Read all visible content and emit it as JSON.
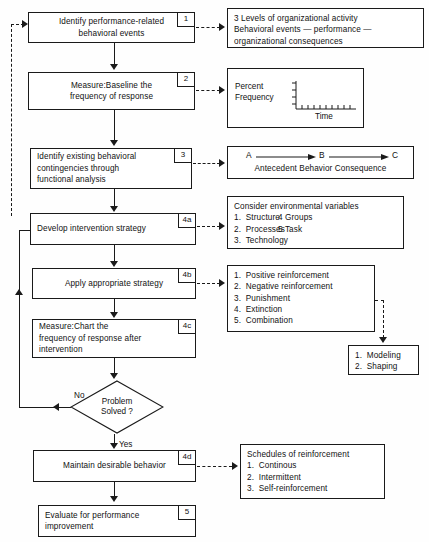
{
  "diagram": {
    "steps": [
      {
        "id": "1",
        "text": "Identify performance-related\nbehavioral events"
      },
      {
        "id": "2",
        "text": "Measure:Baseline the\nfrequency of response"
      },
      {
        "id": "3",
        "text": "Identify existing behavioral\ncontingencies through\nfunctional analysis"
      },
      {
        "id": "4a",
        "text": "Develop intervention strategy"
      },
      {
        "id": "4b",
        "text": "Apply appropriate strategy"
      },
      {
        "id": "4c",
        "text": "Measure:Chart the\nfrequency of response after\nintervention"
      },
      {
        "id": "4d",
        "text": "Maintain desirable behavior"
      },
      {
        "id": "5",
        "text": "Evaluate for performance\nimprovement"
      }
    ],
    "decision": {
      "text": "Problem\nSolved ?",
      "no_label": "No",
      "yes_label": "Yes"
    },
    "panels": {
      "levels": {
        "lines": [
          "3 Levels of organizational activity",
          "Behavioral events — performance —",
          "organizational consequences"
        ]
      },
      "chart": {
        "ylabel": "Percent\nFrequency",
        "xlabel": "Time",
        "y_ticks": 4,
        "x_ticks": 9
      },
      "abc": {
        "nodes": [
          "A",
          "B",
          "C"
        ],
        "caption": "Antecedent Behavior Consequence"
      },
      "environment": {
        "heading": "Consider environmental variables",
        "items_left": [
          "1.  Structure",
          "2.  Processes",
          "3.  Technology"
        ],
        "items_right": [
          "4 Groups",
          "5 Task"
        ]
      },
      "strategies": {
        "items": [
          "1.  Positive reinforcement",
          "2.  Negative reinforcement",
          "3.  Punishment",
          "4.  Extinction",
          "5.  Combination"
        ]
      },
      "shaping": {
        "items": [
          "1.  Modeling",
          "2.  Shaping"
        ]
      },
      "schedules": {
        "heading": "Schedules of reinforcement",
        "items": [
          "1.  Continous",
          "2.  Intermittent",
          "3.  Self-reinforcement"
        ]
      }
    },
    "colors": {
      "ink": "#1a1a1a",
      "paper": "#fefefe"
    }
  }
}
